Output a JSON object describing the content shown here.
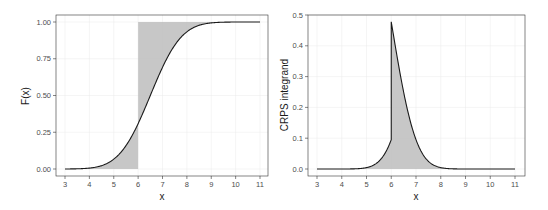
{
  "chart_data": [
    {
      "type": "line",
      "title": "",
      "xlabel": "x",
      "ylabel": "F(x)",
      "xlim": [
        3,
        11
      ],
      "ylim": [
        0,
        1
      ],
      "x_ticks": [
        3,
        4,
        5,
        6,
        7,
        8,
        9,
        10,
        11
      ],
      "x_tick_labels": [
        "3",
        "4",
        "5",
        "6",
        "7",
        "8",
        "9",
        "10",
        "11"
      ],
      "y_ticks": [
        0,
        0.25,
        0.5,
        0.75,
        1.0
      ],
      "y_tick_labels": [
        "0.00",
        "0.25",
        "0.50",
        "0.75",
        "1.00"
      ],
      "grid": true,
      "legend": null,
      "series": [
        {
          "name": "F(x) (normal CDF, mean 6.5, sd 1)",
          "x": [
            3,
            3.5,
            4,
            4.5,
            5,
            5.5,
            6,
            6.5,
            7,
            7.5,
            8,
            8.5,
            9,
            9.5,
            10,
            10.5,
            11
          ],
          "y": [
            0.0002,
            0.0013,
            0.0062,
            0.0228,
            0.0668,
            0.1587,
            0.3085,
            0.5,
            0.6915,
            0.8413,
            0.9332,
            0.9772,
            0.9938,
            0.9987,
            0.9998,
            1.0,
            1.0
          ]
        }
      ],
      "annotations": [
        {
          "type": "shaded-area",
          "description": "area between F(x) and 0 for x<6, and between F(x) and 1 for x>=6",
          "observation": 6
        }
      ]
    },
    {
      "type": "area",
      "title": "",
      "xlabel": "x",
      "ylabel": "CRPS integrand",
      "xlim": [
        3,
        11
      ],
      "ylim": [
        0,
        0.5
      ],
      "x_ticks": [
        3,
        4,
        5,
        6,
        7,
        8,
        9,
        10,
        11
      ],
      "x_tick_labels": [
        "3",
        "4",
        "5",
        "6",
        "7",
        "8",
        "9",
        "10",
        "11"
      ],
      "y_ticks": [
        0,
        0.1,
        0.2,
        0.3,
        0.4,
        0.5
      ],
      "y_tick_labels": [
        "0.0",
        "0.1",
        "0.2",
        "0.3",
        "0.4",
        "0.5"
      ],
      "grid": true,
      "legend": null,
      "series": [
        {
          "name": "CRPS integrand (F(x)-1{x>=6})^2",
          "x": [
            3,
            3.5,
            4,
            4.5,
            5,
            5.5,
            6,
            6,
            6.5,
            7,
            7.5,
            8,
            8.5,
            9,
            9.5,
            10,
            10.5,
            11
          ],
          "y": [
            0.0,
            0.0,
            0.0,
            0.0005,
            0.0045,
            0.0252,
            0.0952,
            0.4782,
            0.25,
            0.0952,
            0.0252,
            0.0045,
            0.0005,
            0.0,
            0.0,
            0.0,
            0.0,
            0.0
          ]
        }
      ],
      "annotations": [
        {
          "type": "shaded-area",
          "description": "area under the integrand curve",
          "observation": 6
        }
      ]
    }
  ],
  "panels": {
    "left": {
      "ylabel": "F(x)",
      "xlabel": "x",
      "y_tick_labels": [
        "0.00",
        "0.25",
        "0.50",
        "0.75",
        "1.00"
      ],
      "x_tick_labels": [
        "3",
        "4",
        "5",
        "6",
        "7",
        "8",
        "9",
        "10",
        "11"
      ]
    },
    "right": {
      "ylabel": "CRPS integrand",
      "xlabel": "x",
      "y_tick_labels": [
        "0.0",
        "0.1",
        "0.2",
        "0.3",
        "0.4",
        "0.5"
      ],
      "x_tick_labels": [
        "3",
        "4",
        "5",
        "6",
        "7",
        "8",
        "9",
        "10",
        "11"
      ]
    }
  },
  "colors": {
    "curve": "#1a1a1a",
    "shade": "#bdbdbd",
    "panel_border": "#333333",
    "grid": "#ebebeb",
    "tick_text": "#4d4d4d"
  }
}
